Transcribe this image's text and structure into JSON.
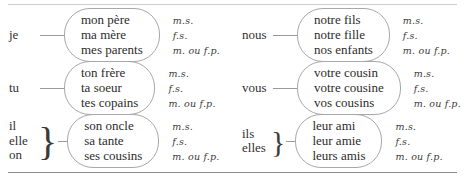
{
  "figure": {
    "rules": {
      "top": true,
      "bottom": true
    },
    "annotation_legend": {
      "masculine_singular": "m.s.",
      "feminine_singular": "f.s.",
      "plural": "m. ou f.p."
    }
  },
  "columns": [
    {
      "side": "left",
      "groups": [
        {
          "pronouns": [
            "je"
          ],
          "brace": false,
          "nouns": [
            "mon père",
            "ma mère",
            "mes parents"
          ],
          "annotations": [
            "m.s.",
            "f.s.",
            "m. ou f.p."
          ]
        },
        {
          "pronouns": [
            "tu"
          ],
          "brace": false,
          "nouns": [
            "ton frère",
            "ta soeur",
            "tes copains"
          ],
          "annotations": [
            "m.s.",
            "f.s.",
            "m. ou f.p."
          ]
        },
        {
          "pronouns": [
            "il",
            "elle",
            "on"
          ],
          "brace": true,
          "nouns": [
            "son oncle",
            "sa tante",
            "ses cousins"
          ],
          "annotations": [
            "m.s.",
            "f.s.",
            "m. ou f.p."
          ]
        }
      ]
    },
    {
      "side": "right",
      "groups": [
        {
          "pronouns": [
            "nous"
          ],
          "brace": false,
          "nouns": [
            "notre fils",
            "notre fille",
            "nos enfants"
          ],
          "annotations": [
            "m.s.",
            "f.s.",
            "m. ou f.p."
          ]
        },
        {
          "pronouns": [
            "vous"
          ],
          "brace": false,
          "nouns": [
            "votre cousin",
            "votre cousine",
            "vos cousins"
          ],
          "annotations": [
            "m.s.",
            "f.s.",
            "m. ou f.p."
          ]
        },
        {
          "pronouns": [
            "ils",
            "elles"
          ],
          "brace": true,
          "nouns": [
            "leur ami",
            "leur amie",
            "leurs amis"
          ],
          "annotations": [
            "m.s.",
            "f.s.",
            "m. ou f.p."
          ]
        }
      ]
    }
  ],
  "glyphs": {
    "brace": "}"
  }
}
